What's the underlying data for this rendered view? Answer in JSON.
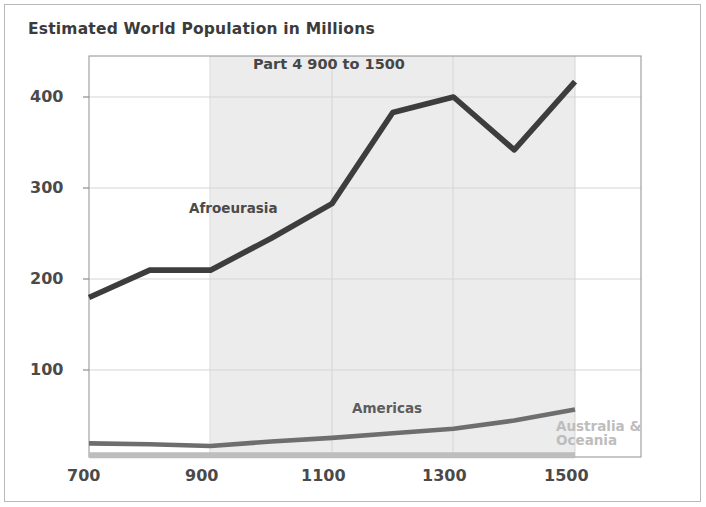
{
  "chart_data": {
    "type": "line",
    "title": "Estimated World Population in Millions",
    "subtitle": "Part 4 900 to 1500",
    "xlabel": "",
    "ylabel": "",
    "x": [
      700,
      800,
      900,
      1000,
      1100,
      1200,
      1300,
      1400,
      1500
    ],
    "xlim": [
      700,
      1500
    ],
    "ylim": [
      0,
      440
    ],
    "xticks": [
      700,
      800,
      900,
      1000,
      1100,
      1200,
      1300,
      1400,
      1500
    ],
    "xtick_labels": [
      "700",
      "",
      "900",
      "",
      "1100",
      "",
      "1300",
      "",
      "1500"
    ],
    "yticks": [
      100,
      200,
      300,
      400
    ],
    "ytick_labels": [
      "100",
      "200",
      "300",
      "400"
    ],
    "grid": true,
    "legend": "inline-annotations",
    "highlight_band": {
      "label": "Part 4 900 to 1500",
      "x_start": 900,
      "x_end": 1500,
      "color": "#ececec"
    },
    "series": [
      {
        "name": "Afroeurasia",
        "color": "#3d3d3d",
        "values": [
          175,
          205,
          205,
          240,
          278,
          378,
          395,
          337,
          412
        ],
        "label_x": 950,
        "label_y": 248
      },
      {
        "name": "Americas",
        "color": "#6e6e6e",
        "values": [
          15,
          14,
          12,
          17,
          21,
          26,
          31,
          40,
          52
        ],
        "label_x": 1150,
        "label_y": 78
      },
      {
        "name": "Australia & Oceania",
        "color": "#bdbdbd",
        "values": [
          2,
          2,
          2,
          2,
          2,
          2,
          2,
          2,
          2
        ],
        "label_x": 1510,
        "label_y": 40
      }
    ]
  },
  "axis": {
    "y_ticks": [
      {
        "value": "400"
      },
      {
        "value": "300"
      },
      {
        "value": "200"
      },
      {
        "value": "100"
      }
    ],
    "x_ticks": [
      {
        "value": "700"
      },
      {
        "value": "900"
      },
      {
        "value": "1100"
      },
      {
        "value": "1300"
      },
      {
        "value": "1500"
      }
    ]
  },
  "annotations": {
    "afroeurasia": "Afroeurasia",
    "americas": "Americas",
    "australia_line1": "Australia &",
    "australia_line2": "Oceania"
  },
  "colors": {
    "title_text": "#3b3b3b",
    "axis_text": "#4a4a4a",
    "afroeurasia_line": "#3d3d3d",
    "americas_line": "#6e6e6e",
    "australia_line": "#bdbdbd",
    "band_fill": "#ececec",
    "plot_border": "#9a9a9a",
    "gridline": "#d8d8d8",
    "frame_border": "#b9b9b9",
    "background": "#ffffff"
  }
}
